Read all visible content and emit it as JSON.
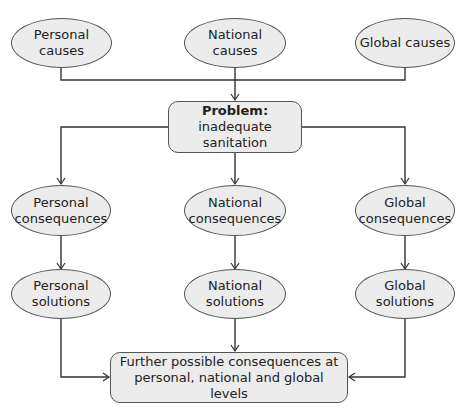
{
  "causes": [
    {
      "label": "Personal causes"
    },
    {
      "label": "National causes"
    },
    {
      "label": "Global causes"
    }
  ],
  "problem": {
    "prefix": "Problem:",
    "text": "inadequate sanitation"
  },
  "consequences": [
    {
      "label": "Personal consequences"
    },
    {
      "label": "National consequences"
    },
    {
      "label": "Global consequences"
    }
  ],
  "solutions": [
    {
      "label": "Personal solutions"
    },
    {
      "label": "National solutions"
    },
    {
      "label": "Global solutions"
    }
  ],
  "outcome": {
    "label": "Further possible consequences at personal, national and global levels"
  },
  "colors": {
    "node_fill": "#ececec",
    "stroke": "#333333"
  }
}
